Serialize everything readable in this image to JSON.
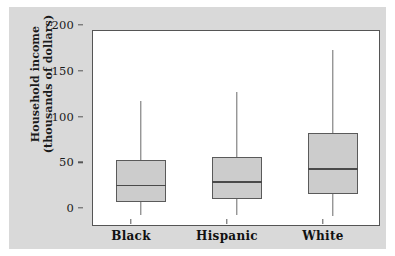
{
  "figure": {
    "background_color": "#d9d9d9",
    "plot_background_color": "#ffffff",
    "frame_color": "#555555",
    "box_fill_color": "#cccccc",
    "box_edge_color": "#5a5a5a"
  },
  "axes": {
    "y_title_line1": "Household income",
    "y_title_line2": "(thousands of dollars)",
    "y_ticks": [
      "0",
      "50",
      "100",
      "150",
      "200"
    ],
    "x_ticks": [
      "Black",
      "Hispanic",
      "White"
    ]
  },
  "chart_data": {
    "type": "box",
    "title": "",
    "xlabel": "",
    "ylabel": "Household income (thousands of dollars)",
    "categories": [
      "Black",
      "Hispanic",
      "White"
    ],
    "ylim": [
      0,
      200
    ],
    "ytick_values": [
      0,
      50,
      100,
      150,
      200
    ],
    "grid": false,
    "legend": "none",
    "boxes": [
      {
        "category": "Black",
        "min": 1,
        "q1": 15,
        "median": 34,
        "q3": 61,
        "max": 126
      },
      {
        "category": "Hispanic",
        "min": 1,
        "q1": 19,
        "median": 38,
        "q3": 65,
        "max": 135
      },
      {
        "category": "White",
        "min": 0,
        "q1": 24,
        "median": 52,
        "q3": 91,
        "max": 181
      }
    ]
  }
}
